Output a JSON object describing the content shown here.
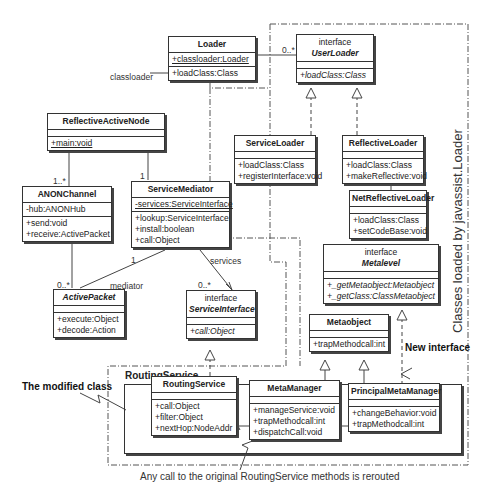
{
  "classes": {
    "loader": {
      "name": "Loader",
      "attrs": [
        "+classloader:Loader"
      ],
      "ops": [
        "+loadClass:Class"
      ]
    },
    "user_loader": {
      "stereotype": "interface",
      "name": "UserLoader",
      "ops": [
        "+loadClass:Class"
      ]
    },
    "reflective_active_node": {
      "name": "ReflectiveActiveNode",
      "ops": [
        "+main:void"
      ]
    },
    "service_loader": {
      "name": "ServiceLoader",
      "ops": [
        "+loadClass:Class",
        "+registerInterface:void"
      ]
    },
    "reflective_loader": {
      "name": "ReflectiveLoader",
      "ops": [
        "+loadClass:Class",
        "+makeReflective:void"
      ]
    },
    "anon_channel": {
      "name": "ANONChannel",
      "attrs": [
        "-hub:ANONHub"
      ],
      "ops": [
        "+send:void",
        "+receive:ActivePacket"
      ]
    },
    "service_mediator": {
      "name": "ServiceMediator",
      "attrs": [
        "-services:ServiceInterface"
      ],
      "ops": [
        "+lookup:ServiceInterface",
        "+install:boolean",
        "+call:Object"
      ]
    },
    "net_reflective_loader": {
      "name": "NetReflectiveLoader",
      "ops": [
        "+loadClass:Class",
        "+setCodeBase:void"
      ]
    },
    "metalevel": {
      "stereotype": "interface",
      "name": "Metalevel",
      "ops": [
        "+_getMetaobject:Metaobject",
        "+_getClass:ClassMetaobject"
      ]
    },
    "active_packet": {
      "name": "ActivePacket",
      "ops": [
        "+execute:Object",
        "+decode:Action"
      ]
    },
    "service_interface": {
      "stereotype": "interface",
      "name": "ServiceInterface",
      "ops": [
        "+call:Object"
      ]
    },
    "metaobject": {
      "name": "Metaobject",
      "ops": [
        "+trapMethodcall:int"
      ]
    },
    "routing_service": {
      "name": "RoutingService",
      "ops": [
        "+call:Object",
        "+filter:Object",
        "+nextHop:NodeAddr"
      ]
    },
    "meta_manager": {
      "name": "MetaManager",
      "ops": [
        "+manageService:void",
        "+trapMethodcall:int",
        "+dispatchCall:void"
      ]
    },
    "principal_meta_manager": {
      "name": "PrincipalMetaManager",
      "ops": [
        "+changeBehavior:void",
        "+trapMethodcall:int"
      ]
    }
  },
  "package": {
    "title": "RoutingService"
  },
  "labels": {
    "classloader": "classloader",
    "mult_userloader": "0..*",
    "mult_anon": "1..*",
    "mult_mediator_top": "1",
    "mult_packet": "0..*",
    "mult_mediator_packet": "1",
    "mediator": "mediator",
    "services": "services",
    "mult_services": "0..*"
  },
  "notes": {
    "modified_class": "The modified class",
    "new_interface": "New interface",
    "rerouted": "Any call to the original RoutingService methods is rerouted",
    "javassist_boundary": "Classes loaded by javassist.Loader"
  }
}
